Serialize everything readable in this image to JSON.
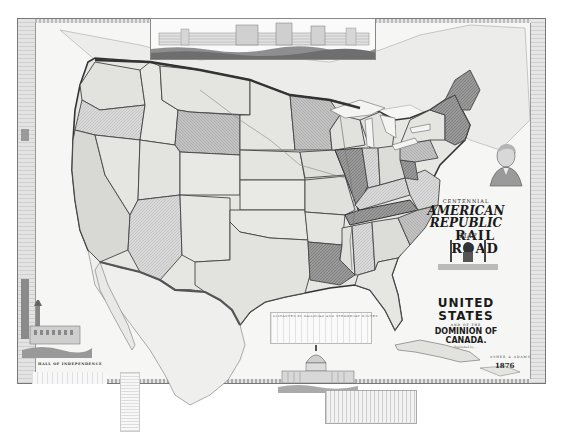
{
  "map": {
    "title_lines": {
      "centennial": "CENTENNIAL",
      "american_republic": "AMERICAN REPUBLIC",
      "railroad": "RAIL ROAD",
      "map": "MAP",
      "of_the": "OF THE",
      "united_states": "UNITED STATES",
      "and_of_the": "AND OF THE",
      "dominion": "DOMINION OF CANADA."
    },
    "publisher_line": "Published by ...",
    "publisher_credit": "ASHER & ADAMS",
    "year": "1876",
    "vignettes": {
      "top_panorama": "Centennial Exhibition building panorama",
      "left_vignette_caption": "HALL OF INDEPENDENCE",
      "bottom_center": "U.S. Capitol",
      "portrait": "George Washington portrait"
    },
    "table_titles": {
      "center_table": "DISTANCES BY RAILROAD AND STEAMBOAT ROUTES"
    },
    "colors": {
      "background": "#ffffff",
      "paper": "#f6f6f4",
      "state_dark": "#8c8c8c",
      "state_mid": "#b5b5b5",
      "state_light": "#dcdcdc",
      "border": "#444444"
    }
  }
}
